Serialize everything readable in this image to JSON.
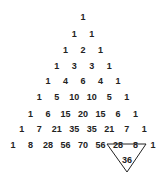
{
  "diagram": {
    "rows": [
      [
        "1"
      ],
      [
        "1",
        "1"
      ],
      [
        "1",
        "2",
        "1"
      ],
      [
        "1",
        "3",
        "3",
        "1"
      ],
      [
        "1",
        "4",
        "6",
        "4",
        "1"
      ],
      [
        "1",
        "5",
        "10",
        "10",
        "5",
        "1"
      ],
      [
        "1",
        "6",
        "15",
        "20",
        "15",
        "6",
        "1"
      ],
      [
        "1",
        "7",
        "21",
        "35",
        "35",
        "21",
        "7",
        "1"
      ],
      [
        "1",
        "8",
        "28",
        "56",
        "70",
        "56",
        "28",
        "8",
        "1"
      ]
    ],
    "highlight": {
      "addends": [
        "28",
        "8"
      ],
      "sum": "36",
      "shape": "inverted-triangle",
      "stroke": "#222222"
    }
  }
}
